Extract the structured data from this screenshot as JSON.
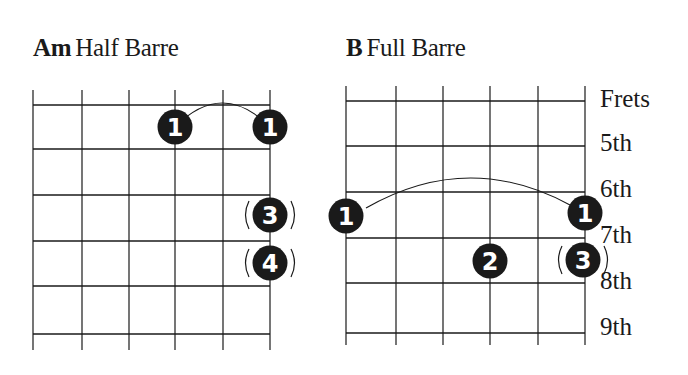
{
  "diagrams": [
    {
      "chord": "Am",
      "type": "Half Barre",
      "grid": {
        "x": [
          33,
          82,
          129,
          175,
          223,
          270
        ],
        "y": [
          105,
          149,
          195,
          241,
          286,
          334
        ],
        "top": 90,
        "bottom": 350
      },
      "barre": {
        "from": [
          175,
          127
        ],
        "to": [
          270,
          127
        ],
        "peak": 103
      },
      "fingers": [
        {
          "label": "1",
          "x": 175,
          "y": 127,
          "optional": false
        },
        {
          "label": "1",
          "x": 270,
          "y": 127,
          "optional": false
        },
        {
          "label": "3",
          "x": 270,
          "y": 215,
          "optional": true
        },
        {
          "label": "4",
          "x": 270,
          "y": 263,
          "optional": true
        }
      ]
    },
    {
      "chord": "B",
      "type": "Full Barre",
      "grid": {
        "x": [
          346,
          396,
          443,
          490,
          538,
          585
        ],
        "y": [
          101,
          146,
          192,
          238,
          283,
          333
        ],
        "top": 86,
        "bottom": 345
      },
      "barre": {
        "from": [
          366,
          208
        ],
        "to": [
          570,
          205
        ],
        "peak": 178
      },
      "fingers": [
        {
          "label": "1",
          "x": 346,
          "y": 216,
          "optional": false
        },
        {
          "label": "1",
          "x": 585,
          "y": 213,
          "optional": false
        },
        {
          "label": "2",
          "x": 490,
          "y": 261,
          "optional": false
        },
        {
          "label": "3",
          "x": 583,
          "y": 260,
          "optional": true
        }
      ]
    }
  ],
  "fret_labels": [
    {
      "text": "Frets",
      "y": 86
    },
    {
      "text": "5th",
      "y": 130
    },
    {
      "text": "6th",
      "y": 176
    },
    {
      "text": "7th",
      "y": 222
    },
    {
      "text": "8th",
      "y": 268
    },
    {
      "text": "9th",
      "y": 314
    }
  ],
  "colors": {
    "ink": "#1a1a1a",
    "dot_text": "#ffffff",
    "background": "#ffffff"
  }
}
